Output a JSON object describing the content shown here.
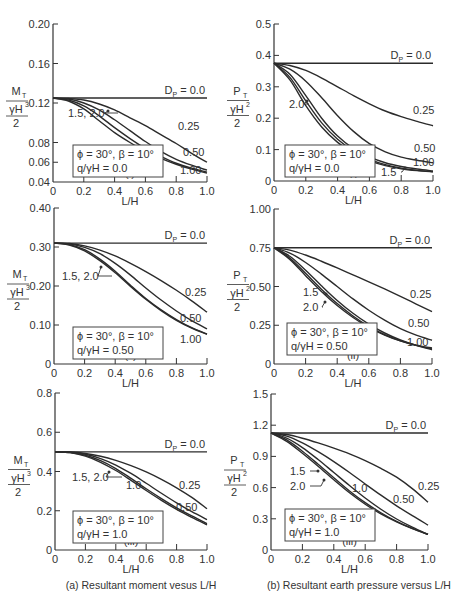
{
  "captions": {
    "left": "(a) Resultant moment vesus L/H",
    "right": "(b) Resultant earth pressure versus L/H"
  },
  "chart_data": [
    {
      "id": "a-i",
      "type": "line",
      "panel_label": "(i)",
      "xlabel": "L/H",
      "ylabel": "M_T / (γH³/2)",
      "xlim": [
        0,
        1.0
      ],
      "ylim": [
        0.04,
        0.2
      ],
      "xticks": [
        "0",
        "0.2",
        "0.4",
        "0.6",
        "0.8",
        "1.0"
      ],
      "yticks": [
        "0.04",
        "0.06",
        "0.08",
        "0.12",
        "0.16",
        "0.20"
      ],
      "ytick_values": [
        0.04,
        0.06,
        0.08,
        0.12,
        0.16,
        0.2
      ],
      "params": [
        "ϕ = 30°, β = 10°",
        "q/γH = 0.0"
      ],
      "series": [
        {
          "name": "Dp = 0.0",
          "x": [
            0,
            1.0
          ],
          "y": [
            0.125,
            0.125
          ]
        },
        {
          "name": "0.25",
          "x": [
            0,
            0.1,
            0.2,
            0.3,
            0.4,
            0.5,
            0.6,
            0.7,
            0.8,
            0.9,
            1.0
          ],
          "y": [
            0.125,
            0.1245,
            0.123,
            0.119,
            0.113,
            0.105,
            0.097,
            0.088,
            0.079,
            0.069,
            0.06
          ]
        },
        {
          "name": "0.50",
          "x": [
            0,
            0.1,
            0.2,
            0.3,
            0.4,
            0.5,
            0.6,
            0.7,
            0.8,
            0.9,
            1.0
          ],
          "y": [
            0.125,
            0.124,
            0.12,
            0.113,
            0.103,
            0.092,
            0.081,
            0.071,
            0.063,
            0.057,
            0.052
          ]
        },
        {
          "name": "1.00",
          "x": [
            0,
            0.1,
            0.2,
            0.3,
            0.4,
            0.5,
            0.6,
            0.7,
            0.8,
            0.9,
            1.0
          ],
          "y": [
            0.125,
            0.123,
            0.117,
            0.107,
            0.095,
            0.084,
            0.074,
            0.066,
            0.059,
            0.054,
            0.05
          ]
        },
        {
          "name": "1.5, 2.0",
          "x": [
            0,
            0.1,
            0.2,
            0.3,
            0.4,
            0.5,
            0.6,
            0.7,
            0.8,
            0.9,
            1.0
          ],
          "y": [
            0.125,
            0.122,
            0.114,
            0.102,
            0.09,
            0.08,
            0.071,
            0.064,
            0.058,
            0.053,
            0.049
          ]
        }
      ]
    },
    {
      "id": "b-i",
      "type": "line",
      "panel_label": "(i)",
      "xlabel": "L/H",
      "ylabel": "P_T / (γH²/2)",
      "xlim": [
        0,
        1.0
      ],
      "ylim": [
        0,
        0.5
      ],
      "xticks": [
        "0",
        "0.2",
        "0.4",
        "0.6",
        "0.8",
        "1.0"
      ],
      "yticks": [
        "0",
        "0.1",
        "0.2",
        "0.3",
        "0.4",
        "0.5"
      ],
      "ytick_values": [
        0,
        0.1,
        0.2,
        0.3,
        0.4,
        0.5
      ],
      "params": [
        "ϕ = 30°, β = 10°",
        "q/γH = 0.0"
      ],
      "series": [
        {
          "name": "Dp = 0.0",
          "x": [
            0,
            1.0
          ],
          "y": [
            0.375,
            0.375
          ]
        },
        {
          "name": "0.25",
          "x": [
            0,
            0.1,
            0.2,
            0.3,
            0.4,
            0.5,
            0.6,
            0.7,
            0.8,
            0.9,
            1.0
          ],
          "y": [
            0.375,
            0.368,
            0.352,
            0.328,
            0.3,
            0.272,
            0.246,
            0.223,
            0.205,
            0.19,
            0.176
          ]
        },
        {
          "name": "0.50",
          "x": [
            0,
            0.1,
            0.2,
            0.3,
            0.4,
            0.5,
            0.6,
            0.7,
            0.8,
            0.9,
            1.0
          ],
          "y": [
            0.375,
            0.356,
            0.318,
            0.265,
            0.208,
            0.158,
            0.119,
            0.093,
            0.076,
            0.066,
            0.058
          ]
        },
        {
          "name": "1.00",
          "x": [
            0,
            0.1,
            0.2,
            0.3,
            0.4,
            0.5,
            0.6,
            0.7,
            0.8,
            0.9,
            1.0
          ],
          "y": [
            0.375,
            0.34,
            0.272,
            0.2,
            0.143,
            0.103,
            0.077,
            0.058,
            0.046,
            0.038,
            0.032
          ]
        },
        {
          "name": "1.5",
          "x": [
            0,
            0.1,
            0.2,
            0.3,
            0.4,
            0.5,
            0.6,
            0.7,
            0.8,
            0.9,
            1.0
          ],
          "y": [
            0.375,
            0.33,
            0.255,
            0.185,
            0.133,
            0.096,
            0.07,
            0.052,
            0.041,
            0.034,
            0.03
          ]
        },
        {
          "name": "2.0",
          "x": [
            0,
            0.1,
            0.2,
            0.3,
            0.4,
            0.5,
            0.6,
            0.7,
            0.8,
            0.9,
            1.0
          ],
          "y": [
            0.375,
            0.322,
            0.24,
            0.172,
            0.123,
            0.089,
            0.065,
            0.049,
            0.039,
            0.033,
            0.029
          ]
        }
      ]
    },
    {
      "id": "a-ii",
      "type": "line",
      "panel_label": "(ii)",
      "xlabel": "L/H",
      "ylabel": "M_T / (γH³/2)",
      "xlim": [
        0,
        1.0
      ],
      "ylim": [
        0,
        0.4
      ],
      "xticks": [
        "0",
        "0.2",
        "0.4",
        "0.6",
        "0.8",
        "1.0"
      ],
      "yticks": [
        "0",
        "0.10",
        "0.20",
        "0.30",
        "0.40"
      ],
      "ytick_values": [
        0,
        0.1,
        0.2,
        0.3,
        0.4
      ],
      "params": [
        "ϕ = 30°, β = 10°",
        "q/γH = 0.50"
      ],
      "series": [
        {
          "name": "Dp = 0.0",
          "x": [
            0,
            1.0
          ],
          "y": [
            0.31,
            0.31
          ]
        },
        {
          "name": "0.25",
          "x": [
            0,
            0.1,
            0.2,
            0.3,
            0.4,
            0.5,
            0.6,
            0.7,
            0.8,
            0.9,
            1.0
          ],
          "y": [
            0.31,
            0.309,
            0.303,
            0.292,
            0.277,
            0.258,
            0.237,
            0.214,
            0.189,
            0.162,
            0.133
          ]
        },
        {
          "name": "0.50",
          "x": [
            0,
            0.1,
            0.2,
            0.3,
            0.4,
            0.5,
            0.6,
            0.7,
            0.8,
            0.9,
            1.0
          ],
          "y": [
            0.31,
            0.308,
            0.299,
            0.283,
            0.258,
            0.228,
            0.195,
            0.164,
            0.136,
            0.111,
            0.09
          ]
        },
        {
          "name": "1.00",
          "x": [
            0,
            0.1,
            0.2,
            0.3,
            0.4,
            0.5,
            0.6,
            0.7,
            0.8,
            0.9,
            1.0
          ],
          "y": [
            0.31,
            0.306,
            0.293,
            0.269,
            0.238,
            0.202,
            0.168,
            0.139,
            0.114,
            0.093,
            0.077
          ]
        },
        {
          "name": "1.5, 2.0",
          "x": [
            0,
            0.1,
            0.2,
            0.3,
            0.4,
            0.5,
            0.6,
            0.7,
            0.8,
            0.9,
            1.0
          ],
          "y": [
            0.31,
            0.305,
            0.29,
            0.265,
            0.234,
            0.199,
            0.166,
            0.137,
            0.112,
            0.092,
            0.076
          ]
        }
      ]
    },
    {
      "id": "b-ii",
      "type": "line",
      "panel_label": "(ii)",
      "xlabel": "L/H",
      "ylabel": "P_T / (γH²/2)",
      "xlim": [
        0,
        1.0
      ],
      "ylim": [
        0,
        1.0
      ],
      "xticks": [
        "0",
        "0.2",
        "0.4",
        "0.6",
        "0.8",
        "1.0"
      ],
      "yticks": [
        "0",
        "0.25",
        "0.50",
        "0.75",
        "1.00"
      ],
      "ytick_values": [
        0,
        0.25,
        0.5,
        0.75,
        1.0
      ],
      "params": [
        "ϕ = 30°, β = 10°",
        "q/γH = 0.50"
      ],
      "series": [
        {
          "name": "Dp = 0.0",
          "x": [
            0,
            1.0
          ],
          "y": [
            0.75,
            0.75
          ]
        },
        {
          "name": "0.25",
          "x": [
            0,
            0.1,
            0.2,
            0.3,
            0.4,
            0.5,
            0.6,
            0.7,
            0.8,
            0.9,
            1.0
          ],
          "y": [
            0.75,
            0.735,
            0.703,
            0.663,
            0.62,
            0.575,
            0.53,
            0.484,
            0.436,
            0.387,
            0.338
          ]
        },
        {
          "name": "0.50",
          "x": [
            0,
            0.1,
            0.2,
            0.3,
            0.4,
            0.5,
            0.6,
            0.7,
            0.8,
            0.9,
            1.0
          ],
          "y": [
            0.75,
            0.716,
            0.655,
            0.58,
            0.5,
            0.42,
            0.347,
            0.283,
            0.228,
            0.186,
            0.153
          ]
        },
        {
          "name": "1.00",
          "x": [
            0,
            0.1,
            0.2,
            0.3,
            0.4,
            0.5,
            0.6,
            0.7,
            0.8,
            0.9,
            1.0
          ],
          "y": [
            0.75,
            0.695,
            0.605,
            0.505,
            0.41,
            0.327,
            0.257,
            0.2,
            0.155,
            0.12,
            0.092
          ]
        },
        {
          "name": "1.5",
          "x": [
            0,
            0.1,
            0.2,
            0.3,
            0.4,
            0.5,
            0.6,
            0.7,
            0.8,
            0.9,
            1.0
          ],
          "y": [
            0.75,
            0.684,
            0.585,
            0.483,
            0.39,
            0.31,
            0.243,
            0.19,
            0.15,
            0.12,
            0.098
          ]
        },
        {
          "name": "2.0",
          "x": [
            0,
            0.1,
            0.2,
            0.3,
            0.4,
            0.5,
            0.6,
            0.7,
            0.8,
            0.9,
            1.0
          ],
          "y": [
            0.75,
            0.675,
            0.57,
            0.468,
            0.377,
            0.3,
            0.237,
            0.187,
            0.149,
            0.122,
            0.103
          ]
        }
      ]
    },
    {
      "id": "a-iii",
      "type": "line",
      "panel_label": "(iii)",
      "xlabel": "L/H",
      "ylabel": "M_T / (γH³/2)",
      "xlim": [
        0,
        1.0
      ],
      "ylim": [
        0,
        0.8
      ],
      "xticks": [
        "0",
        "0.2",
        "0.4",
        "0.6",
        "0.8",
        "1.0"
      ],
      "yticks": [
        "0",
        "0.2",
        "0.4",
        "0.6",
        "0.8"
      ],
      "ytick_values": [
        0,
        0.2,
        0.4,
        0.6,
        0.8
      ],
      "params": [
        "ϕ = 30°, β = 10°",
        "q/γH = 1.0"
      ],
      "series": [
        {
          "name": "Dp = 0.0",
          "x": [
            0,
            1.0
          ],
          "y": [
            0.5,
            0.5
          ]
        },
        {
          "name": "0.25",
          "x": [
            0,
            0.1,
            0.2,
            0.3,
            0.4,
            0.5,
            0.6,
            0.7,
            0.8,
            0.9,
            1.0
          ],
          "y": [
            0.5,
            0.499,
            0.492,
            0.478,
            0.457,
            0.43,
            0.398,
            0.36,
            0.317,
            0.268,
            0.21
          ]
        },
        {
          "name": "0.50",
          "x": [
            0,
            0.1,
            0.2,
            0.3,
            0.4,
            0.5,
            0.6,
            0.7,
            0.8,
            0.9,
            1.0
          ],
          "y": [
            0.5,
            0.498,
            0.488,
            0.466,
            0.433,
            0.39,
            0.34,
            0.289,
            0.24,
            0.195,
            0.155
          ]
        },
        {
          "name": "1.0",
          "x": [
            0,
            0.1,
            0.2,
            0.3,
            0.4,
            0.5,
            0.6,
            0.7,
            0.8,
            0.9,
            1.0
          ],
          "y": [
            0.5,
            0.497,
            0.483,
            0.455,
            0.415,
            0.365,
            0.312,
            0.262,
            0.215,
            0.174,
            0.135
          ]
        },
        {
          "name": "1.5, 2.0",
          "x": [
            0,
            0.1,
            0.2,
            0.3,
            0.4,
            0.5,
            0.6,
            0.7,
            0.8,
            0.9,
            1.0
          ],
          "y": [
            0.5,
            0.496,
            0.478,
            0.447,
            0.405,
            0.355,
            0.303,
            0.253,
            0.207,
            0.166,
            0.128
          ]
        }
      ]
    },
    {
      "id": "b-iii",
      "type": "line",
      "panel_label": "(iii)",
      "xlabel": "L/H",
      "ylabel": "P_T / (γH²/2)",
      "xlim": [
        0,
        1.0
      ],
      "ylim": [
        0,
        1.5
      ],
      "xticks": [
        "0",
        "0.2",
        "0.4",
        "0.6",
        "0.8",
        "1.0"
      ],
      "yticks": [
        "0",
        "0.3",
        "0.6",
        "0.9",
        "1.2",
        "1.5"
      ],
      "ytick_values": [
        0,
        0.3,
        0.6,
        0.9,
        1.2,
        1.5
      ],
      "params": [
        "ϕ = 30°, β = 10°",
        "q/γH = 1.0"
      ],
      "series": [
        {
          "name": "Dp = 0.0",
          "x": [
            0,
            1.0
          ],
          "y": [
            1.125,
            1.125
          ]
        },
        {
          "name": "0.25",
          "x": [
            0,
            0.1,
            0.2,
            0.3,
            0.4,
            0.5,
            0.6,
            0.7,
            0.8,
            0.9,
            1.0
          ],
          "y": [
            1.125,
            1.11,
            1.075,
            1.03,
            0.98,
            0.925,
            0.86,
            0.785,
            0.7,
            0.59,
            0.46
          ]
        },
        {
          "name": "0.50",
          "x": [
            0,
            0.1,
            0.2,
            0.3,
            0.4,
            0.5,
            0.6,
            0.7,
            0.8,
            0.9,
            1.0
          ],
          "y": [
            1.125,
            1.095,
            1.03,
            0.945,
            0.85,
            0.745,
            0.635,
            0.527,
            0.425,
            0.33,
            0.24
          ]
        },
        {
          "name": "1.0",
          "x": [
            0,
            0.1,
            0.2,
            0.3,
            0.4,
            0.5,
            0.6,
            0.7,
            0.8,
            0.9,
            1.0
          ],
          "y": [
            1.125,
            1.075,
            0.985,
            0.87,
            0.745,
            0.62,
            0.5,
            0.392,
            0.298,
            0.219,
            0.15
          ]
        },
        {
          "name": "1.5",
          "x": [
            0,
            0.1,
            0.2,
            0.3,
            0.4,
            0.5,
            0.6,
            0.7,
            0.8,
            0.9,
            1.0
          ],
          "y": [
            1.125,
            1.058,
            0.95,
            0.825,
            0.695,
            0.568,
            0.455,
            0.358,
            0.275,
            0.208,
            0.15
          ]
        },
        {
          "name": "2.0",
          "x": [
            0,
            0.1,
            0.2,
            0.3,
            0.4,
            0.5,
            0.6,
            0.7,
            0.8,
            0.9,
            1.0
          ],
          "y": [
            1.125,
            1.045,
            0.93,
            0.805,
            0.675,
            0.55,
            0.44,
            0.347,
            0.27,
            0.205,
            0.15
          ]
        }
      ]
    }
  ],
  "annotations": {
    "dp_label": "Dp = 0.0"
  }
}
